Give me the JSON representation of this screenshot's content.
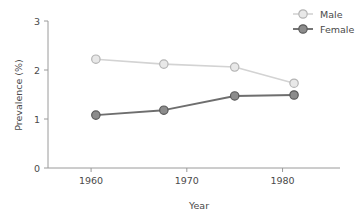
{
  "chart_data": {
    "type": "line",
    "title": "",
    "subtitle": "",
    "xlabel": "Year",
    "ylabel": "Prevalence (%)",
    "xlim": [
      1955.5,
      1986.0
    ],
    "ylim": [
      0,
      3
    ],
    "xticks": [
      1960,
      1970,
      1980
    ],
    "xtick_labels": [
      "1960",
      "1970",
      "1980"
    ],
    "yticks": [
      0,
      1,
      2,
      3
    ],
    "ytick_labels": [
      "0",
      "1",
      "2",
      "3"
    ],
    "grid": false,
    "legend_position": "top-right",
    "x": [
      1960.5,
      1967.6,
      1975.0,
      1981.2
    ],
    "series": [
      {
        "name": "Male",
        "color": "#d3d3d3",
        "marker": "open-circle",
        "marker_fill": "#e8e8e8",
        "marker_edge": "#b4b4b4",
        "values": [
          2.22,
          2.12,
          2.06,
          1.73
        ]
      },
      {
        "name": "Female",
        "color": "#6e6e6e",
        "marker": "filled-circle",
        "marker_fill": "#8c8c8c",
        "marker_edge": "#5a5a5a",
        "values": [
          1.08,
          1.18,
          1.47,
          1.49
        ]
      }
    ]
  },
  "legend": {
    "items": [
      {
        "label": "Male"
      },
      {
        "label": "Female"
      }
    ]
  },
  "axes": {
    "x_title": "Year",
    "y_title": "Prevalence (%)"
  },
  "colors": {
    "background": "#ffffff",
    "axis": "#9a9a9a",
    "text": "#4a4a4a",
    "male": "#d3d3d3",
    "female": "#6e6e6e"
  }
}
